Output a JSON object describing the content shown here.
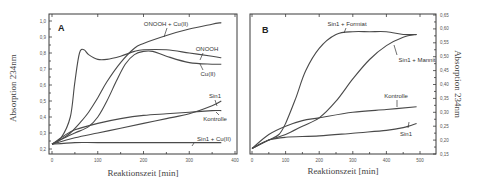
{
  "chart_data": [
    {
      "type": "line",
      "panel_label": "A",
      "xlabel": "Reaktionszeit [min]",
      "ylabel": "Absorption 234nm",
      "xlim": [
        0,
        400
      ],
      "ylim": [
        0.2,
        1.0
      ],
      "xticks": [
        0,
        100,
        200,
        300,
        400
      ],
      "yticks": [
        "0,2",
        "0,3",
        "0,4",
        "0,5",
        "0,6",
        "0,7",
        "0,8",
        "0,9",
        "1,0"
      ],
      "grid": false,
      "series": [
        {
          "name": "ONOOH + Cu(II)",
          "x": [
            0,
            20,
            40,
            60,
            80,
            100,
            120,
            150,
            180,
            200,
            250,
            300,
            350,
            370
          ],
          "y": [
            0.23,
            0.26,
            0.3,
            0.36,
            0.43,
            0.52,
            0.62,
            0.74,
            0.83,
            0.86,
            0.91,
            0.95,
            0.98,
            0.99
          ]
        },
        {
          "name": "ONOOH",
          "x": [
            0,
            20,
            40,
            50,
            60,
            70,
            80,
            100,
            120,
            150,
            180,
            200,
            250,
            300,
            350,
            370
          ],
          "y": [
            0.23,
            0.27,
            0.4,
            0.62,
            0.8,
            0.82,
            0.79,
            0.76,
            0.76,
            0.78,
            0.81,
            0.82,
            0.82,
            0.8,
            0.78,
            0.77
          ]
        },
        {
          "name": "Cu(II)",
          "x": [
            0,
            20,
            50,
            80,
            100,
            120,
            140,
            160,
            180,
            200,
            220,
            250,
            300,
            350,
            370
          ],
          "y": [
            0.23,
            0.26,
            0.3,
            0.34,
            0.4,
            0.5,
            0.62,
            0.73,
            0.79,
            0.81,
            0.81,
            0.78,
            0.74,
            0.73,
            0.73
          ]
        },
        {
          "name": "Sin1",
          "x": [
            0,
            50,
            100,
            150,
            200,
            250,
            300,
            350,
            370
          ],
          "y": [
            0.23,
            0.27,
            0.3,
            0.33,
            0.36,
            0.39,
            0.42,
            0.47,
            0.5
          ]
        },
        {
          "name": "Kontrolle",
          "x": [
            0,
            25,
            50,
            100,
            150,
            200,
            250,
            300,
            350,
            370
          ],
          "y": [
            0.23,
            0.28,
            0.32,
            0.36,
            0.39,
            0.41,
            0.42,
            0.43,
            0.44,
            0.44
          ]
        },
        {
          "name": "Sin1 + Cu(II)",
          "x": [
            0,
            50,
            100,
            200,
            300,
            370
          ],
          "y": [
            0.23,
            0.24,
            0.24,
            0.24,
            0.24,
            0.24
          ]
        }
      ]
    },
    {
      "type": "line",
      "panel_label": "B",
      "xlabel": "Reaktionszeit [min]",
      "ylabel": "Absorption 234nm",
      "xlim": [
        0,
        550
      ],
      "ylim": [
        0.15,
        0.65
      ],
      "xticks": [
        0,
        100,
        200,
        300,
        400,
        500
      ],
      "yticks": [
        "0,15",
        "0,20",
        "0,25",
        "0,30",
        "0,35",
        "0,40",
        "0,45",
        "0,50",
        "0,55",
        "0,60",
        "0,65"
      ],
      "y_axis_side": "right",
      "grid": false,
      "series": [
        {
          "name": "Sin1 + Formiat",
          "x": [
            0,
            50,
            80,
            100,
            130,
            160,
            200,
            250,
            300,
            350,
            400,
            450,
            490
          ],
          "y": [
            0.17,
            0.2,
            0.22,
            0.26,
            0.35,
            0.45,
            0.53,
            0.58,
            0.59,
            0.59,
            0.59,
            0.58,
            0.58
          ]
        },
        {
          "name": "Sin1 + Mannit",
          "x": [
            0,
            50,
            100,
            150,
            200,
            250,
            300,
            350,
            400,
            450,
            490
          ],
          "y": [
            0.17,
            0.2,
            0.22,
            0.25,
            0.28,
            0.34,
            0.42,
            0.49,
            0.54,
            0.57,
            0.58
          ]
        },
        {
          "name": "Kontrolle",
          "x": [
            0,
            50,
            100,
            150,
            200,
            300,
            400,
            490
          ],
          "y": [
            0.17,
            0.22,
            0.25,
            0.27,
            0.28,
            0.3,
            0.31,
            0.32
          ]
        },
        {
          "name": "Sin1",
          "x": [
            0,
            50,
            100,
            200,
            300,
            400,
            450,
            490
          ],
          "y": [
            0.17,
            0.2,
            0.21,
            0.215,
            0.225,
            0.235,
            0.245,
            0.26
          ]
        }
      ]
    }
  ],
  "panels": {
    "a": {
      "label": "A",
      "xlabel": "Reaktionszeit [min]",
      "ylabel": "Absorption 234nm",
      "xticks": [
        "0",
        "100",
        "200",
        "300",
        "400"
      ],
      "yticks": [
        "1,0",
        "0,9",
        "0,8",
        "0,7",
        "0,6",
        "0,5",
        "0,4",
        "0,3",
        "0,2"
      ],
      "series_labels": [
        "ONOOH + Cu(II)",
        "ONOOH",
        "Cu(II)",
        "Sin1",
        "Kontrolle",
        "Sin1 + Cu(II)"
      ]
    },
    "b": {
      "label": "B",
      "xlabel": "Reaktionszeit [min]",
      "ylabel": "Absorption 234nm",
      "xticks": [
        "0",
        "100",
        "200",
        "300",
        "400",
        "500"
      ],
      "yticks": [
        "0,65",
        "0,60",
        "0,55",
        "0,50",
        "0,45",
        "0,40",
        "0,35",
        "0,30",
        "0,25",
        "0,20",
        "0,15"
      ],
      "series_labels": [
        "Sin1 + Formiat",
        "Sin1 + Mannit",
        "Kontrolle",
        "Sin1"
      ]
    }
  }
}
